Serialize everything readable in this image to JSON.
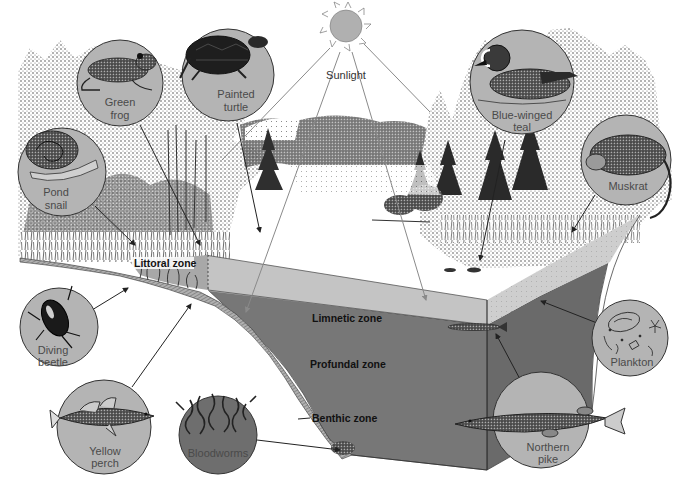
{
  "diagram": {
    "type": "lake-ecosystem-cross-section",
    "colors": {
      "background": "#ffffff",
      "circle_fill": "#b4b4b4",
      "circle_dark_fill": "#6e6e6e",
      "limnetic_fill": "#c2c2c2",
      "profundal_fill": "#777777",
      "side_fill": "#6a6a6a",
      "sediment_fill": "#9a9a9a",
      "sun_fill": "#b0b0b0",
      "vegetation": "#3a3a3a",
      "ray_line": "#8a8a8a",
      "pointer_line": "#222222"
    },
    "sun": {
      "label": "Sunlight"
    },
    "zones": {
      "littoral": "Littoral zone",
      "limnetic": "Limnetic zone",
      "profundal": "Profundal zone",
      "benthic": "Benthic zone"
    },
    "organisms": [
      {
        "id": "green-frog",
        "line1": "Green",
        "line2": "frog"
      },
      {
        "id": "painted-turtle",
        "line1": "Painted",
        "line2": "turtle"
      },
      {
        "id": "pond-snail",
        "line1": "Pond",
        "line2": "snail"
      },
      {
        "id": "blue-winged-teal",
        "line1": "Blue-winged",
        "line2": "teal"
      },
      {
        "id": "muskrat",
        "line1": "Muskrat",
        "line2": ""
      },
      {
        "id": "diving-beetle",
        "line1": "Diving",
        "line2": "beetle"
      },
      {
        "id": "yellow-perch",
        "line1": "Yellow",
        "line2": "perch"
      },
      {
        "id": "bloodworms",
        "line1": "Bloodworms",
        "line2": ""
      },
      {
        "id": "plankton",
        "line1": "Plankton",
        "line2": ""
      },
      {
        "id": "northern-pike",
        "line1": "Northern",
        "line2": "pike"
      }
    ]
  }
}
